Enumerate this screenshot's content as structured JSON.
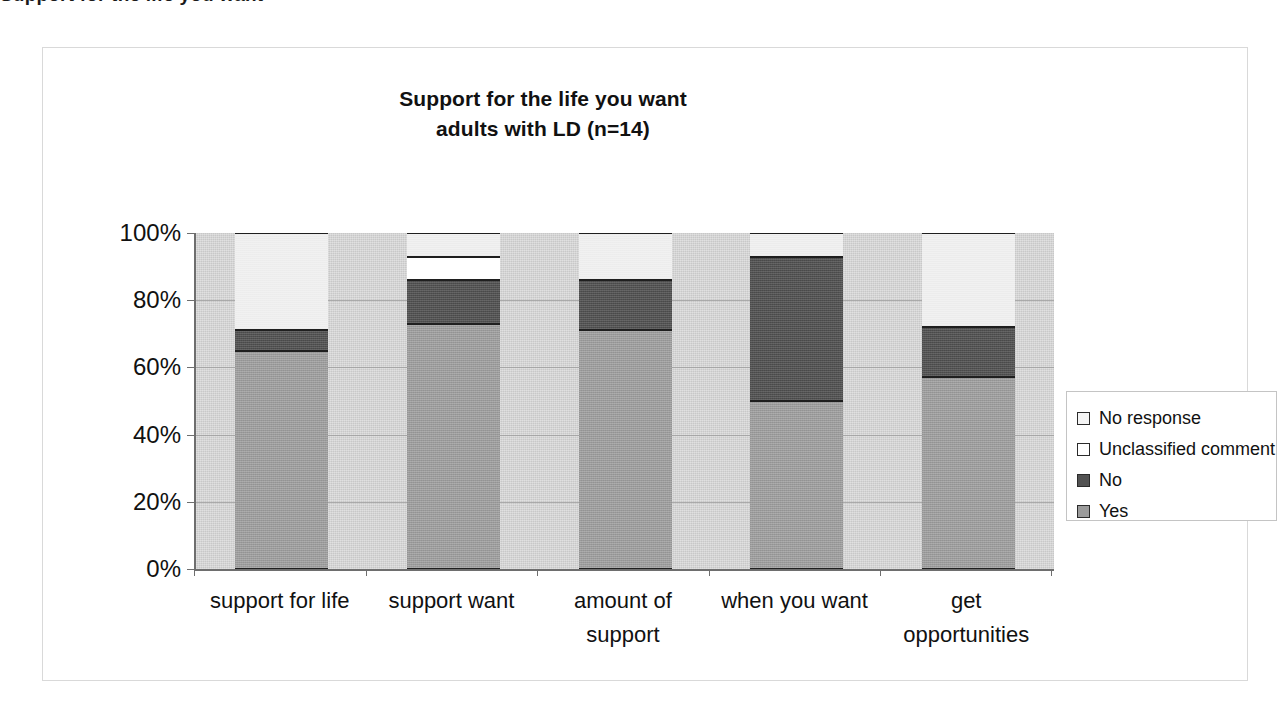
{
  "page": {
    "clipped_header_text": "Support for the life you want"
  },
  "chart_data": {
    "type": "bar",
    "subtype": "stacked-100-percent",
    "title": "Support for the life you want",
    "subtitle": "adults with LD (n=14)",
    "title_lines": [
      "Support for the life you want",
      "adults with LD (n=14)"
    ],
    "xlabel": "",
    "ylabel": "",
    "ylim": [
      0,
      100
    ],
    "yticks": [
      0,
      20,
      40,
      60,
      80,
      100
    ],
    "ytick_labels": [
      "0%",
      "20%",
      "40%",
      "60%",
      "80%",
      "100%"
    ],
    "grid": true,
    "legend_position": "right",
    "categories": [
      "support for life",
      "support want",
      "amount of support",
      "when you want",
      "get opportunities"
    ],
    "category_label_lines": [
      [
        "support for life"
      ],
      [
        "support want"
      ],
      [
        "amount of",
        "support"
      ],
      [
        "when you want"
      ],
      [
        "get",
        "opportunities"
      ]
    ],
    "series": [
      {
        "name": "Yes",
        "color": "#9b9b9b",
        "values": [
          65,
          73,
          71,
          50,
          57
        ]
      },
      {
        "name": "No",
        "color": "#525252",
        "values": [
          6,
          13,
          15,
          43,
          15
        ]
      },
      {
        "name": "Unclassified comment",
        "color": "#ffffff",
        "values": [
          0,
          7,
          0,
          0,
          0
        ]
      },
      {
        "name": "No response",
        "color": "#f1f1f1",
        "values": [
          29,
          7,
          14,
          7,
          28
        ]
      }
    ],
    "legend_entries": [
      {
        "label": "No response",
        "color": "#f1f1f1"
      },
      {
        "label": "Unclassified comment",
        "color": "#ffffff"
      },
      {
        "label": "No",
        "color": "#525252"
      },
      {
        "label": "Yes",
        "color": "#9b9b9b"
      }
    ],
    "plot_background": "#c8c8c8"
  }
}
